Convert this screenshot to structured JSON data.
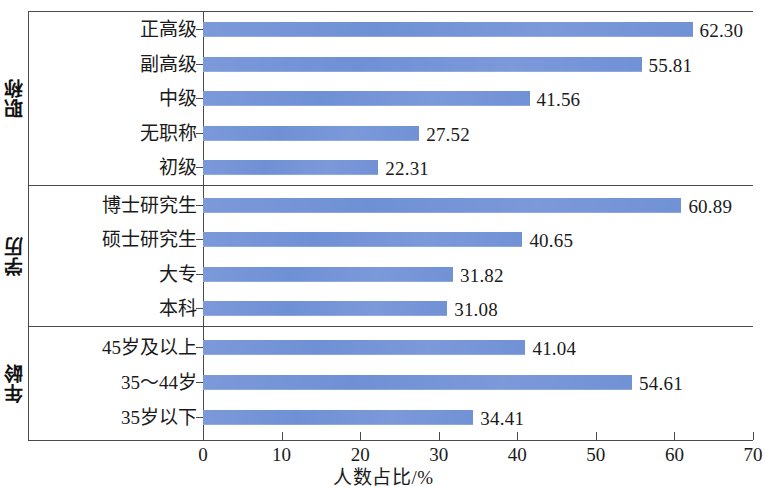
{
  "chart_data": {
    "type": "bar",
    "orientation": "horizontal",
    "title": "",
    "xlabel": "人数占比/%",
    "ylabel": "",
    "xlim": [
      0,
      70
    ],
    "xticks": [
      0,
      10,
      20,
      30,
      40,
      50,
      60,
      70
    ],
    "grid": false,
    "legend": false,
    "bar_color": "#6d8ed5",
    "axis_color": "#4a4a4a",
    "groups": [
      {
        "name": "职称",
        "categories": [
          "正高级",
          "副高级",
          "中级",
          "无职称",
          "初级"
        ],
        "values": [
          62.3,
          55.81,
          41.56,
          27.52,
          22.31
        ],
        "value_labels": [
          "62.30",
          "55.81",
          "41.56",
          "27.52",
          "22.31"
        ]
      },
      {
        "name": "学历",
        "categories": [
          "博士研究生",
          "硕士研究生",
          "大专",
          "本科"
        ],
        "values": [
          60.89,
          40.65,
          31.82,
          31.08
        ],
        "value_labels": [
          "60.89",
          "40.65",
          "31.82",
          "31.08"
        ]
      },
      {
        "name": "年龄",
        "categories": [
          "45岁及以上",
          "35～44岁",
          "35岁以下"
        ],
        "values": [
          41.04,
          54.61,
          34.41
        ],
        "value_labels": [
          "41.04",
          "54.61",
          "34.41"
        ]
      }
    ],
    "categories": [
      "正高级",
      "副高级",
      "中级",
      "无职称",
      "初级",
      "博士研究生",
      "硕士研究生",
      "大专",
      "本科",
      "45岁及以上",
      "35～44岁",
      "35岁以下"
    ],
    "values": [
      62.3,
      55.81,
      41.56,
      27.52,
      22.31,
      60.89,
      40.65,
      31.82,
      31.08,
      41.04,
      54.61,
      34.41
    ]
  }
}
